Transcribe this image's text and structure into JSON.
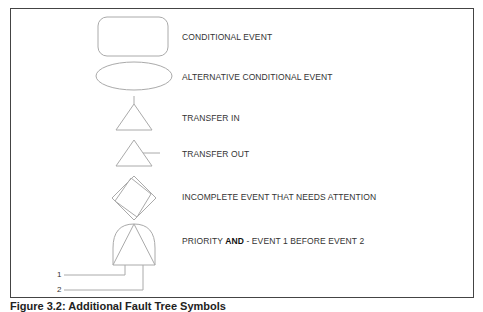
{
  "figure": {
    "caption": "Figure 3.2: Additional Fault Tree Symbols"
  },
  "symbols": [
    {
      "shape": "rounded-rectangle",
      "label": "CONDITIONAL EVENT"
    },
    {
      "shape": "ellipse",
      "label": "ALTERNATIVE CONDITIONAL EVENT"
    },
    {
      "shape": "triangle-with-top-line",
      "label": "TRANSFER IN"
    },
    {
      "shape": "triangle-with-side-line",
      "label": "TRANSFER OUT"
    },
    {
      "shape": "double-diamond",
      "label": "INCOMPLETE EVENT THAT NEEDS ATTENTION"
    },
    {
      "shape": "priority-and-gate",
      "label_prefix": "PRIORITY ",
      "label_bold": "AND",
      "label_suffix": " - EVENT 1 BEFORE EVENT 2",
      "inputs": [
        "1",
        "2"
      ]
    }
  ],
  "colors": {
    "stroke": "#aaaaaa",
    "frame": "#444444",
    "text": "#333333"
  }
}
